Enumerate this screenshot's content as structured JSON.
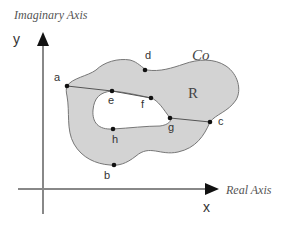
{
  "axes": {
    "y_title": "Imaginary Axis",
    "y_letter": "y",
    "x_title": "Real Axis",
    "x_letter": "x"
  },
  "region": {
    "name": "R",
    "contour": "Co",
    "fill_color": "#d3d3d3",
    "stroke_color": "#777777"
  },
  "points": [
    {
      "id": "a",
      "label": "a"
    },
    {
      "id": "b",
      "label": "b"
    },
    {
      "id": "c",
      "label": "c"
    },
    {
      "id": "d",
      "label": "d"
    },
    {
      "id": "e",
      "label": "e"
    },
    {
      "id": "f",
      "label": "f"
    },
    {
      "id": "g",
      "label": "g"
    },
    {
      "id": "h",
      "label": "h"
    }
  ]
}
